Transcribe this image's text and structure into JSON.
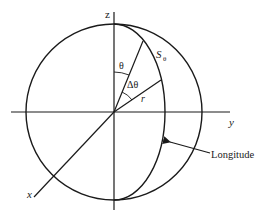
{
  "diagram": {
    "axes": {
      "z_label": "z",
      "y_label": "y",
      "x_label": "x"
    },
    "angles": {
      "theta_label": "θ",
      "delta_theta_label": "Δθ"
    },
    "radius_label": "r",
    "arc_label_main": "S",
    "arc_label_sub": "θ",
    "callout_label": "Longitude",
    "colors": {
      "stroke": "#1a1a1a",
      "background": "#ffffff"
    }
  }
}
